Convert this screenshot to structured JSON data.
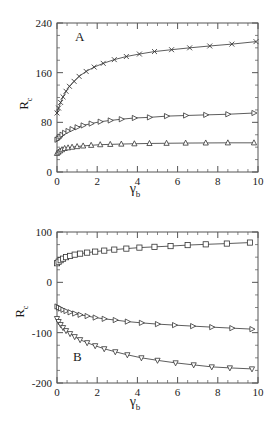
{
  "figure": {
    "width": 274,
    "height": 422,
    "background": "#ffffff",
    "axis_color": "#555555",
    "data_color": "#333333"
  },
  "chart_data": [
    {
      "type": "line",
      "panel_label": "A",
      "title": "",
      "xlabel": "γ",
      "xlabel_sub": "b",
      "ylabel": "R",
      "ylabel_sub": "c",
      "xlim": [
        0,
        10
      ],
      "ylim": [
        0,
        240
      ],
      "xticks": [
        0,
        2,
        4,
        6,
        8,
        10
      ],
      "xtick_labels": [
        "0",
        "2",
        "4",
        "6",
        "8",
        "10"
      ],
      "xminor_step": 0.5,
      "yticks": [
        0,
        80,
        160,
        240
      ],
      "ytick_labels": [
        "0",
        "80",
        "160",
        "240"
      ],
      "yminor_step": 20,
      "grid": false,
      "legend": "none",
      "series": [
        {
          "name": "cross-series",
          "marker": "x",
          "x": [
            0.0,
            0.08,
            0.18,
            0.3,
            0.45,
            0.62,
            0.85,
            1.1,
            1.45,
            1.85,
            2.3,
            2.85,
            3.45,
            4.1,
            4.85,
            5.7,
            6.6,
            7.6,
            8.7,
            9.9
          ],
          "y": [
            95,
            103,
            112,
            121,
            130,
            138,
            146,
            154,
            162,
            169,
            175,
            181,
            186,
            190,
            194,
            197,
            200,
            203,
            206,
            210
          ]
        },
        {
          "name": "right-triangle-series",
          "marker": "triangle-right",
          "x": [
            0.0,
            0.07,
            0.15,
            0.25,
            0.38,
            0.55,
            0.75,
            1.0,
            1.3,
            1.7,
            2.15,
            2.65,
            3.2,
            3.85,
            4.6,
            5.45,
            6.4,
            7.4,
            8.5,
            9.8
          ],
          "y": [
            52,
            54,
            57,
            60,
            63,
            66,
            69,
            72,
            75,
            78,
            81,
            83,
            85,
            87,
            88,
            90,
            91,
            92,
            93,
            95
          ]
        },
        {
          "name": "up-triangle-series",
          "marker": "triangle-up",
          "x": [
            0.0,
            0.07,
            0.15,
            0.25,
            0.38,
            0.55,
            0.75,
            1.0,
            1.3,
            1.7,
            2.15,
            2.65,
            3.2,
            3.85,
            4.6,
            5.45,
            6.4,
            7.4,
            8.5,
            9.8
          ],
          "y": [
            30,
            32,
            34,
            36,
            38,
            39,
            40,
            41,
            42,
            43,
            44,
            44.5,
            45,
            45.5,
            46,
            46.3,
            46.6,
            46.8,
            47,
            47
          ]
        }
      ]
    },
    {
      "type": "line",
      "panel_label": "B",
      "title": "",
      "xlabel": "γ",
      "xlabel_sub": "b",
      "ylabel": "R",
      "ylabel_sub": "c",
      "xlim": [
        0,
        10
      ],
      "ylim": [
        -200,
        100
      ],
      "xticks": [
        0,
        2,
        4,
        6,
        8,
        10
      ],
      "xtick_labels": [
        "0",
        "2",
        "4",
        "6",
        "8",
        "10"
      ],
      "xminor_step": 0.5,
      "yticks": [
        -200,
        -100,
        0,
        100
      ],
      "ytick_labels": [
        "-200",
        "-100",
        "0",
        "100"
      ],
      "yminor_step": 25,
      "grid": false,
      "legend": "none",
      "series": [
        {
          "name": "square-series",
          "marker": "square",
          "x": [
            0.0,
            0.08,
            0.18,
            0.3,
            0.45,
            0.65,
            0.88,
            1.15,
            1.5,
            1.9,
            2.35,
            2.85,
            3.45,
            4.1,
            4.85,
            5.65,
            6.5,
            7.4,
            8.45,
            9.6
          ],
          "y": [
            38,
            41,
            44,
            47,
            50,
            52.5,
            55,
            57,
            59,
            61,
            63,
            65,
            67,
            69,
            70.5,
            72,
            74,
            75.5,
            77,
            79
          ]
        },
        {
          "name": "right-triangle-series",
          "marker": "triangle-right",
          "x": [
            0.0,
            0.08,
            0.18,
            0.3,
            0.45,
            0.65,
            0.88,
            1.15,
            1.5,
            1.9,
            2.35,
            2.9,
            3.5,
            4.2,
            5.0,
            5.85,
            6.75,
            7.7,
            8.7,
            9.7
          ],
          "y": [
            -48,
            -50,
            -52,
            -54.5,
            -57,
            -59.5,
            -62,
            -64.5,
            -67,
            -70,
            -72.5,
            -75,
            -78,
            -80.5,
            -83,
            -85,
            -87,
            -89,
            -91,
            -93
          ]
        },
        {
          "name": "down-triangle-series",
          "marker": "triangle-down",
          "x": [
            0.0,
            0.08,
            0.18,
            0.3,
            0.45,
            0.65,
            0.88,
            1.15,
            1.5,
            1.9,
            2.35,
            2.9,
            3.5,
            4.2,
            5.0,
            5.9,
            6.8,
            7.7,
            8.6,
            9.7
          ],
          "y": [
            -72,
            -78,
            -84,
            -90,
            -96,
            -102,
            -108,
            -114,
            -120,
            -126,
            -132,
            -138,
            -144,
            -150,
            -155,
            -160,
            -164,
            -168,
            -170,
            -172
          ]
        }
      ]
    }
  ]
}
